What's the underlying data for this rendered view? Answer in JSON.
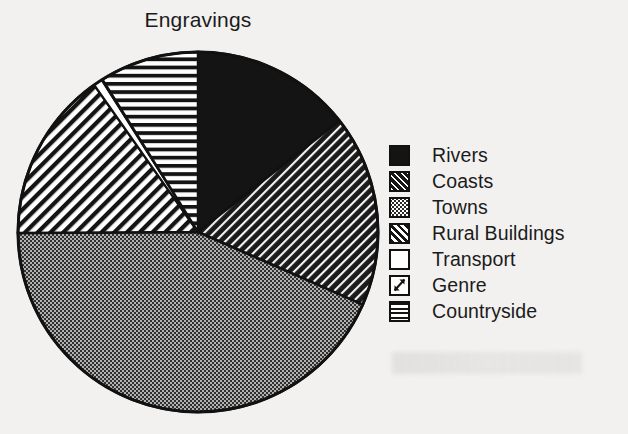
{
  "chart_data": {
    "type": "pie",
    "title": "Engravings",
    "xlabel": "",
    "ylabel": "",
    "legend_position": "right",
    "grid": false,
    "categories": [
      "Rivers",
      "Coasts",
      "Towns",
      "Rural Buildings",
      "Transport",
      "Genre",
      "Countryside"
    ],
    "values": [
      14.4,
      17.2,
      43.3,
      15.3,
      0.8,
      0.1,
      8.9
    ],
    "slices": [
      {
        "label": "Rivers",
        "value": 14.4,
        "start_angle": 0,
        "end_angle": 51.8,
        "pattern": "solid-black",
        "fill": "#141414"
      },
      {
        "label": "Coasts",
        "value": 17.2,
        "start_angle": 51.8,
        "end_angle": 113.8,
        "pattern": "dark-diagonal",
        "fill": "#1a1a1a"
      },
      {
        "label": "Towns",
        "value": 43.3,
        "start_angle": 113.8,
        "end_angle": 269.7,
        "pattern": "stipple-dots",
        "fill": "#2e2e2e"
      },
      {
        "label": "Rural Buildings",
        "value": 15.3,
        "start_angle": 269.7,
        "end_angle": 324.8,
        "pattern": "diagonal-stripes",
        "fill": "#ffffff"
      },
      {
        "label": "Transport",
        "value": 0.8,
        "start_angle": 324.8,
        "end_angle": 327.6,
        "pattern": "empty-white",
        "fill": "#ffffff"
      },
      {
        "label": "Genre",
        "value": 0.1,
        "start_angle": 327.6,
        "end_angle": 327.9,
        "pattern": "white-arrow",
        "fill": "#ffffff"
      },
      {
        "label": "Countryside",
        "value": 8.9,
        "start_angle": 327.9,
        "end_angle": 360,
        "pattern": "horizontal-lines",
        "fill": "#ffffff"
      }
    ]
  },
  "legend": {
    "items": [
      {
        "label": "Rivers",
        "pattern": "solid-black"
      },
      {
        "label": "Coasts",
        "pattern": "dark-diagonal"
      },
      {
        "label": "Towns",
        "pattern": "stipple-dots"
      },
      {
        "label": "Rural Buildings",
        "pattern": "diagonal-stripes"
      },
      {
        "label": "Transport",
        "pattern": "empty-white"
      },
      {
        "label": "Genre",
        "pattern": "white-arrow"
      },
      {
        "label": "Countryside",
        "pattern": "horizontal-lines"
      }
    ]
  },
  "colors": {
    "ink": "#141414",
    "paper": "#f2f1ef"
  }
}
